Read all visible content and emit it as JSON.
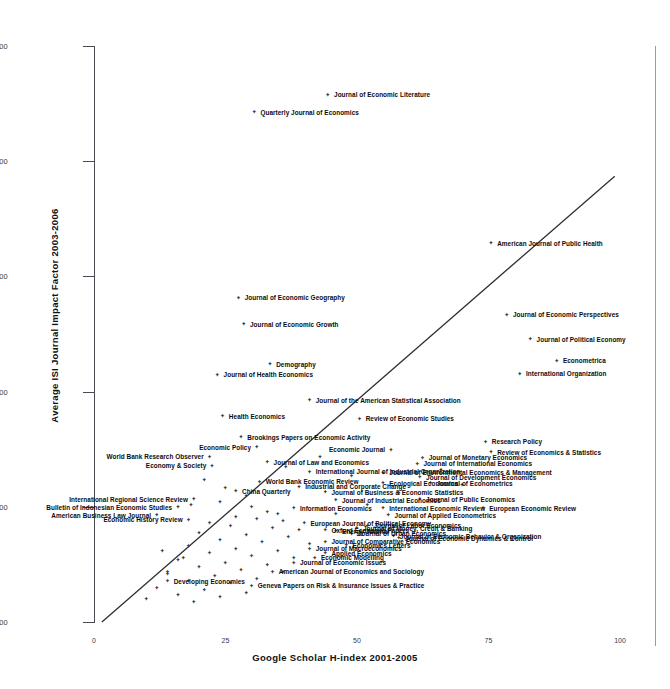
{
  "chart_data": {
    "type": "scatter",
    "title": "",
    "xlabel": "Google Scholar H-index 2001-2005",
    "ylabel": "Average ISI Journal Impact Factor 2003-2006",
    "xlim": [
      0,
      108
    ],
    "ylim": [
      0,
      5.0
    ],
    "xticks": [
      0,
      25,
      50,
      75,
      100
    ],
    "xtick_labels": [
      "0",
      "25",
      "50",
      "75",
      "100"
    ],
    "yticks": [
      0.0,
      1.0,
      2.0,
      3.0,
      4.0,
      5.0
    ],
    "ytick_labels": [
      "0.00",
      "1.00",
      "2.00",
      "3.00",
      "4.00",
      "5.00"
    ],
    "grid": false,
    "legend": null,
    "marker": "diamond",
    "trendline": {
      "visible": true,
      "x0": 1.5,
      "y0": 0.0,
      "x1": 99.0,
      "y1": 3.87
    },
    "labeled_points": [
      {
        "label": "Journal of Economic Literature",
        "x": 44.5,
        "y": 4.58,
        "side": "right"
      },
      {
        "label": "Quarterly Journal of Economics",
        "x": 30.5,
        "y": 4.43,
        "side": "right"
      },
      {
        "label": "American Journal of Public Health",
        "x": 75.5,
        "y": 3.29,
        "side": "right"
      },
      {
        "label": "Journal of Economic Geography",
        "x": 27.5,
        "y": 2.82,
        "side": "right"
      },
      {
        "label": "Journal of Economic Perspectives",
        "x": 78.5,
        "y": 2.67,
        "side": "right"
      },
      {
        "label": "Journal of Economic Growth",
        "x": 28.5,
        "y": 2.59,
        "side": "right"
      },
      {
        "label": "Journal of Political Economy",
        "x": 83.0,
        "y": 2.46,
        "side": "right"
      },
      {
        "label": "Econometrica",
        "x": 88.0,
        "y": 2.27,
        "side": "right"
      },
      {
        "label": "Demography",
        "x": 33.5,
        "y": 2.24,
        "side": "right"
      },
      {
        "label": "International Organization",
        "x": 81.0,
        "y": 2.16,
        "side": "right"
      },
      {
        "label": "Journal of Health Economics",
        "x": 23.5,
        "y": 2.15,
        "side": "right"
      },
      {
        "label": "Journal of the American Statistical Association",
        "x": 41.0,
        "y": 1.93,
        "side": "right"
      },
      {
        "label": "Health Economics",
        "x": 24.5,
        "y": 1.79,
        "side": "right"
      },
      {
        "label": "Review of Economic Studies",
        "x": 50.5,
        "y": 1.77,
        "side": "right"
      },
      {
        "label": "Brookings Papers on Economic Activity",
        "x": 28.0,
        "y": 1.61,
        "side": "right"
      },
      {
        "label": "Research Policy",
        "x": 74.5,
        "y": 1.57,
        "side": "right"
      },
      {
        "label": "Economic Policy",
        "x": 31.0,
        "y": 1.52,
        "side": "left"
      },
      {
        "label": "Economic Journal",
        "x": 56.5,
        "y": 1.5,
        "side": "left"
      },
      {
        "label": "Review of Economics & Statistics",
        "x": 75.5,
        "y": 1.48,
        "side": "right"
      },
      {
        "label": "World Bank Research Observer",
        "x": 22.0,
        "y": 1.44,
        "side": "left"
      },
      {
        "label": "Journal of Monetary Economics",
        "x": 62.5,
        "y": 1.43,
        "side": "right"
      },
      {
        "label": "Journal of Law and Economics",
        "x": 33.0,
        "y": 1.39,
        "side": "right"
      },
      {
        "label": "Journal of International Economics",
        "x": 61.5,
        "y": 1.38,
        "side": "right"
      },
      {
        "label": "Economy & Society",
        "x": 22.5,
        "y": 1.36,
        "side": "left"
      },
      {
        "label": "International Journal of Industrial Organization",
        "x": 41.0,
        "y": 1.31,
        "side": "right"
      },
      {
        "label": "Journal of Environmental Economics & Management",
        "x": 55.0,
        "y": 1.3,
        "side": "right"
      },
      {
        "label": "Journal of Development Economics",
        "x": 62.0,
        "y": 1.26,
        "side": "right"
      },
      {
        "label": "World Bank Economic Review",
        "x": 31.5,
        "y": 1.22,
        "side": "right"
      },
      {
        "label": "Ecological Economics",
        "x": 55.0,
        "y": 1.21,
        "side": "right"
      },
      {
        "label": "Journal of Econometrics",
        "x": 64.0,
        "y": 1.21,
        "side": "right"
      },
      {
        "label": "Industrial and Corporate Change",
        "x": 39.0,
        "y": 1.18,
        "side": "right"
      },
      {
        "label": "China Quarterly",
        "x": 27.0,
        "y": 1.14,
        "side": "right"
      },
      {
        "label": "Journal of Business & Economic Statistics",
        "x": 44.0,
        "y": 1.13,
        "side": "right"
      },
      {
        "label": "International Regional Science Review",
        "x": 19.0,
        "y": 1.07,
        "side": "left"
      },
      {
        "label": "Journal of Public Economics",
        "x": 62.0,
        "y": 1.07,
        "side": "right"
      },
      {
        "label": "Journal of Industrial Economics",
        "x": 46.0,
        "y": 1.06,
        "side": "right"
      },
      {
        "label": "Bulletin of Indonesian Economic Studies",
        "x": 16.0,
        "y": 1.0,
        "side": "left"
      },
      {
        "label": "Information Economics",
        "x": 38.0,
        "y": 0.99,
        "side": "right"
      },
      {
        "label": "International Economic Review",
        "x": 55.0,
        "y": 0.99,
        "side": "right"
      },
      {
        "label": "European Economic Review",
        "x": 74.0,
        "y": 0.99,
        "side": "right"
      },
      {
        "label": "American Business Law Journal",
        "x": 12.0,
        "y": 0.93,
        "side": "left"
      },
      {
        "label": "Journal of Applied Econometrics",
        "x": 56.0,
        "y": 0.93,
        "side": "right"
      },
      {
        "label": "Economic History Review",
        "x": 18.0,
        "y": 0.89,
        "side": "left"
      },
      {
        "label": "European Journal of Political Economy",
        "x": 40.0,
        "y": 0.86,
        "side": "right"
      },
      {
        "label": "Journal of Labor Economics",
        "x": 52.0,
        "y": 0.84,
        "side": "right"
      },
      {
        "label": "Journal of Money, Credit & Banking",
        "x": 50.0,
        "y": 0.82,
        "side": "right"
      },
      {
        "label": "Oxford Economic Papers",
        "x": 44.0,
        "y": 0.8,
        "side": "right"
      },
      {
        "label": "Energy Journal",
        "x": 46.0,
        "y": 0.79,
        "side": "right"
      },
      {
        "label": "Journal of Urban Economics",
        "x": 49.0,
        "y": 0.77,
        "side": "right"
      },
      {
        "label": "Journal of Economic Behavior & Organization",
        "x": 57.0,
        "y": 0.75,
        "side": "right"
      },
      {
        "label": "Journal of Economic Dynamics & Control",
        "x": 58.0,
        "y": 0.73,
        "side": "right"
      },
      {
        "label": "Journal of Comparative Economics",
        "x": 44.0,
        "y": 0.7,
        "side": "right"
      },
      {
        "label": "Economics Letters",
        "x": 48.0,
        "y": 0.67,
        "side": "right"
      },
      {
        "label": "Journal of Macroeconomics",
        "x": 41.0,
        "y": 0.64,
        "side": "right"
      },
      {
        "label": "Applied Economics",
        "x": 44.0,
        "y": 0.6,
        "side": "right"
      },
      {
        "label": "Economic Modelling",
        "x": 42.0,
        "y": 0.56,
        "side": "right"
      },
      {
        "label": "Journal of Economic Issues",
        "x": 38.0,
        "y": 0.52,
        "side": "right"
      },
      {
        "label": "American Journal of Economics and Sociology",
        "x": 34.0,
        "y": 0.44,
        "side": "right"
      },
      {
        "label": "Developing Economies",
        "x": 14.0,
        "y": 0.36,
        "side": "right"
      },
      {
        "label": "Geneva Papers on Risk & Insurance Issues & Practice",
        "x": 30.0,
        "y": 0.32,
        "side": "right"
      }
    ],
    "unlabeled_points": [
      {
        "x": 21.0,
        "y": 1.24
      },
      {
        "x": 25.0,
        "y": 1.17
      },
      {
        "x": 29.0,
        "y": 1.1
      },
      {
        "x": 24.0,
        "y": 1.05
      },
      {
        "x": 18.5,
        "y": 1.02
      },
      {
        "x": 30.0,
        "y": 1.0
      },
      {
        "x": 33.0,
        "y": 0.96
      },
      {
        "x": 35.0,
        "y": 0.94
      },
      {
        "x": 27.0,
        "y": 0.92
      },
      {
        "x": 31.0,
        "y": 0.9
      },
      {
        "x": 36.0,
        "y": 0.88
      },
      {
        "x": 22.0,
        "y": 0.86
      },
      {
        "x": 26.0,
        "y": 0.84
      },
      {
        "x": 34.0,
        "y": 0.82
      },
      {
        "x": 39.0,
        "y": 0.8
      },
      {
        "x": 20.0,
        "y": 0.78
      },
      {
        "x": 29.0,
        "y": 0.76
      },
      {
        "x": 37.0,
        "y": 0.74
      },
      {
        "x": 24.0,
        "y": 0.72
      },
      {
        "x": 32.0,
        "y": 0.7
      },
      {
        "x": 41.0,
        "y": 0.68
      },
      {
        "x": 18.0,
        "y": 0.66
      },
      {
        "x": 27.0,
        "y": 0.64
      },
      {
        "x": 35.0,
        "y": 0.62
      },
      {
        "x": 22.0,
        "y": 0.6
      },
      {
        "x": 30.0,
        "y": 0.58
      },
      {
        "x": 38.0,
        "y": 0.56
      },
      {
        "x": 16.0,
        "y": 0.54
      },
      {
        "x": 25.0,
        "y": 0.52
      },
      {
        "x": 33.0,
        "y": 0.5
      },
      {
        "x": 20.0,
        "y": 0.48
      },
      {
        "x": 28.0,
        "y": 0.46
      },
      {
        "x": 36.0,
        "y": 0.44
      },
      {
        "x": 14.0,
        "y": 0.42
      },
      {
        "x": 23.0,
        "y": 0.4
      },
      {
        "x": 31.0,
        "y": 0.38
      },
      {
        "x": 18.0,
        "y": 0.36
      },
      {
        "x": 26.0,
        "y": 0.34
      },
      {
        "x": 12.0,
        "y": 0.3
      },
      {
        "x": 21.0,
        "y": 0.28
      },
      {
        "x": 29.0,
        "y": 0.26
      },
      {
        "x": 16.0,
        "y": 0.24
      },
      {
        "x": 24.0,
        "y": 0.22
      },
      {
        "x": 10.0,
        "y": 0.2
      },
      {
        "x": 19.0,
        "y": 0.18
      },
      {
        "x": 14.0,
        "y": 0.44
      },
      {
        "x": 17.0,
        "y": 0.56
      },
      {
        "x": 13.0,
        "y": 0.62
      },
      {
        "x": 46.0,
        "y": 0.94
      },
      {
        "x": 52.0,
        "y": 1.02
      },
      {
        "x": 58.0,
        "y": 1.12
      },
      {
        "x": 66.0,
        "y": 1.32
      },
      {
        "x": 70.0,
        "y": 1.19
      },
      {
        "x": 49.0,
        "y": 1.27
      },
      {
        "x": 43.0,
        "y": 1.44
      },
      {
        "x": 36.5,
        "y": 1.35
      }
    ]
  }
}
